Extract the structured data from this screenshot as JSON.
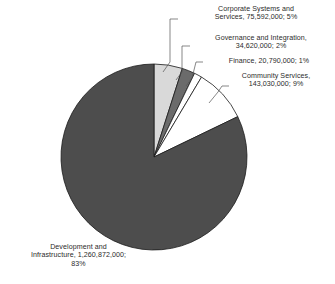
{
  "chart_data": {
    "type": "pie",
    "title": "",
    "categories": [
      "Corporate Systems and Services",
      "Governance and Integration",
      "Finance",
      "Community Services",
      "Development and Infrastructure"
    ],
    "values": [
      75592000,
      34620000,
      20790000,
      143030000,
      1260872000
    ],
    "percentages": [
      5,
      2,
      1,
      9,
      83
    ],
    "value_labels": [
      "75,592,000",
      "34,620,000",
      "20,790,000",
      "143,030,000",
      "1,260,872,000"
    ],
    "colors": [
      "#d9d9d9",
      "#6b6b6b",
      "#ffffff",
      "#ffffff",
      "#4d4d4d"
    ],
    "slice_order_clockwise_from_top": [
      "Corporate Systems and Services",
      "Governance and Integration",
      "Finance",
      "Community Services",
      "Development and Infrastructure"
    ],
    "legend": "none",
    "grid": false,
    "data_labels_position": "outside-with-leader-lines",
    "xlabel": "",
    "ylabel": ""
  },
  "labels": {
    "corporate": "Corporate Systems and\nServices, 75,592,000; 5%",
    "governance": "Governance and Integration,\n34,620,000; 2%",
    "finance": "Finance, 20,790,000; 1%",
    "community": "Community Services,\n143,030,000; 9%",
    "development": "Development and\nInfrastructure, 1,260,872,000;\n83%"
  },
  "style": {
    "background": "#ffffff",
    "outline_color": "#1a1a1a",
    "leader_line_color": "#555555",
    "text_color": "#2b2b2b"
  }
}
